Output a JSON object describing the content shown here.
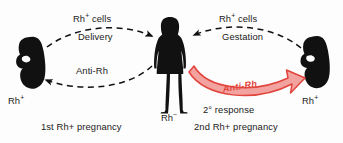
{
  "diagram": {
    "background_color": "#fdfdfd",
    "ink_color": "#1a1a1a",
    "accent_color": "#e2453d",
    "accent_fill_color": "#f2a3a0"
  },
  "left_cycle": {
    "fetus_label": "Rh",
    "fetus_sign": "+",
    "caption": "1st Rh+ pregnancy",
    "top_arrow": {
      "label_main": "Rh",
      "label_sign": "+",
      "label_suffix": " cells",
      "label_sub": "Delivery",
      "direction": "fetus-to-mother",
      "style": "dashed"
    },
    "bottom_arrow": {
      "label": "Anti-Rh",
      "direction": "mother-to-fetus",
      "style": "dashed"
    }
  },
  "mother": {
    "label_main": "Rh",
    "label_sign": "−",
    "figure": "woman-silhouette"
  },
  "right_cycle": {
    "fetus_label": "Rh",
    "fetus_sign": "+",
    "caption": "2nd Rh+ pregnancy",
    "top_arrow": {
      "label_main": "Rh",
      "label_sign": "+",
      "label_suffix": " cells",
      "label_sub": "Gestation",
      "direction": "fetus-to-mother",
      "style": "dashed"
    },
    "response_arrow": {
      "label": "Anti-Rh",
      "caption": "2° response",
      "direction": "mother-to-fetus",
      "style": "solid-band",
      "fill": "#f2a3a0",
      "stroke": "#e2453d"
    }
  }
}
